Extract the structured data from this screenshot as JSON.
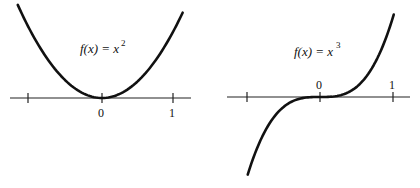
{
  "panels": [
    {
      "id": "square",
      "formula_prefix": "f(x) = x",
      "formula_exp": "2",
      "tick_labels": [
        "0",
        "1"
      ],
      "function": "x^2"
    },
    {
      "id": "cube",
      "formula_prefix": "f(x) = x",
      "formula_exp": "3",
      "tick_labels": [
        "0",
        "1"
      ],
      "function": "x^3"
    }
  ],
  "colors": {
    "curve": "#111111",
    "axis": "#222222",
    "background": "#ffffff"
  }
}
